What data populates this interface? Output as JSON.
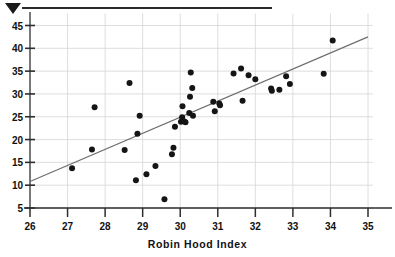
{
  "figure": {
    "top_rule": "horizontal-rule",
    "marker": "down-triangle-marker",
    "background_color": "#ffffff"
  },
  "chart_data": {
    "type": "scatter",
    "title": "",
    "subtitle": "",
    "xlabel": "Robin Hood Index",
    "ylabel": "",
    "xlim": [
      26,
      35
    ],
    "ylim": [
      5,
      45
    ],
    "xticks": [
      26,
      27,
      28,
      29,
      30,
      31,
      32,
      33,
      34,
      35
    ],
    "yticks": [
      5,
      10,
      15,
      20,
      25,
      30,
      35,
      40,
      45
    ],
    "xtick_labels": [
      "26",
      "27",
      "28",
      "29",
      "30",
      "31",
      "32",
      "33",
      "34",
      "35"
    ],
    "ytick_labels": [
      "5",
      "10",
      "15",
      "20",
      "25",
      "30",
      "35",
      "40",
      "45"
    ],
    "grid": true,
    "grid_color": "#d5d5d5",
    "legend": null,
    "marker_color": "#151515",
    "marker_size": 3.0,
    "trendline": {
      "type": "linear-fit",
      "color": "#6e6e6e",
      "width": 1.2,
      "x_start": 26.0,
      "y_start": 10.8,
      "x_end": 35.0,
      "y_end": 42.5
    },
    "points": [
      [
        27.12,
        13.7
      ],
      [
        27.65,
        17.8
      ],
      [
        27.72,
        27.1
      ],
      [
        28.52,
        17.7
      ],
      [
        28.65,
        32.4
      ],
      [
        28.82,
        11.1
      ],
      [
        28.86,
        21.3
      ],
      [
        28.92,
        25.2
      ],
      [
        29.1,
        12.4
      ],
      [
        29.34,
        14.2
      ],
      [
        29.58,
        6.9
      ],
      [
        29.78,
        16.8
      ],
      [
        29.82,
        18.2
      ],
      [
        29.86,
        22.8
      ],
      [
        30.02,
        23.9
      ],
      [
        30.05,
        24.9
      ],
      [
        30.06,
        27.3
      ],
      [
        30.1,
        24.0
      ],
      [
        30.14,
        23.8
      ],
      [
        30.24,
        25.8
      ],
      [
        30.26,
        29.4
      ],
      [
        30.28,
        34.7
      ],
      [
        30.32,
        31.3
      ],
      [
        30.34,
        25.2
      ],
      [
        30.88,
        28.3
      ],
      [
        30.92,
        26.2
      ],
      [
        31.04,
        27.9
      ],
      [
        31.06,
        27.5
      ],
      [
        31.42,
        34.5
      ],
      [
        31.62,
        35.6
      ],
      [
        31.66,
        28.5
      ],
      [
        31.82,
        34.1
      ],
      [
        32.0,
        33.2
      ],
      [
        32.42,
        31.2
      ],
      [
        32.44,
        30.7
      ],
      [
        32.64,
        30.9
      ],
      [
        32.82,
        33.9
      ],
      [
        32.92,
        32.2
      ],
      [
        33.82,
        34.4
      ],
      [
        34.06,
        41.7
      ]
    ],
    "n_points": 40
  }
}
